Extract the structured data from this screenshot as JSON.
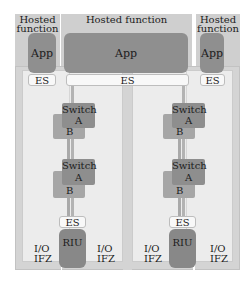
{
  "diagram": {
    "type": "avionics-network-architecture",
    "hosted_functions": [
      {
        "label": "Hosted function",
        "app": "App",
        "es": "ES",
        "position": "left"
      },
      {
        "label": "Hosted function",
        "app": "App",
        "es": "ES",
        "position": "center"
      },
      {
        "label": "Hosted function",
        "app": "App",
        "es": "ES",
        "position": "right"
      }
    ],
    "cabinets": [
      {
        "position": "left",
        "switches": [
          {
            "title": "Switch",
            "plane_a": "A",
            "plane_b": "B"
          },
          {
            "title": "Switch",
            "plane_a": "A",
            "plane_b": "B"
          }
        ],
        "es": "ES",
        "riu": "RIU",
        "io_left": {
          "line1": "I/O",
          "line2": "IFZ"
        },
        "io_right": {
          "line1": "I/O",
          "line2": "IFZ"
        }
      },
      {
        "position": "right",
        "switches": [
          {
            "title": "Switch",
            "plane_a": "A",
            "plane_b": "B"
          },
          {
            "title": "Switch",
            "plane_a": "A",
            "plane_b": "B"
          }
        ],
        "es": "ES",
        "riu": "RIU",
        "io_left": {
          "line1": "I/O",
          "line2": "IFZ"
        },
        "io_right": {
          "line1": "I/O",
          "line2": "IFZ"
        }
      }
    ],
    "colors": {
      "header_bg": "#cfcfcf",
      "cabinet_bg": "#d4d4d4",
      "panel_bg": "#ececec",
      "app_fill": "#8f8f8f",
      "switch_a_fill": "#8e8e8e",
      "switch_b_fill": "#a6a6a6",
      "riu_fill": "#888888",
      "es_fill": "#f8f8f8"
    }
  }
}
